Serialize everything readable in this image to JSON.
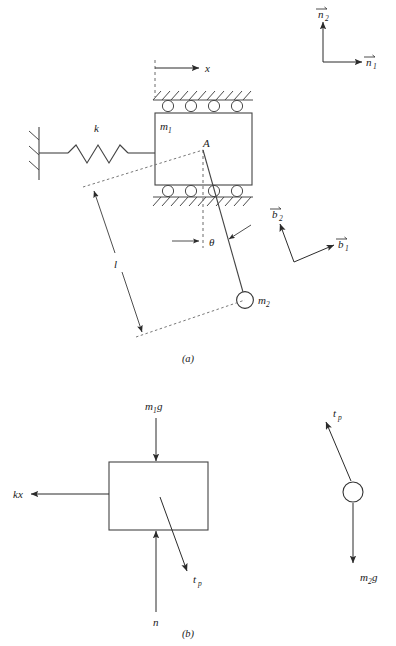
{
  "figure": {
    "panels": [
      {
        "id": "a",
        "label": "(a)",
        "caption": "System schematic"
      },
      {
        "id": "b",
        "label": "(b)",
        "caption": "Free-body diagrams"
      }
    ]
  },
  "panel_a": {
    "labels": {
      "spring_constant": "k",
      "cart_mass": "m",
      "cart_mass_sub": "1",
      "bob_mass": "m",
      "bob_mass_sub": "2",
      "displacement": "x",
      "pivot": "A",
      "rod_length": "l",
      "angle": "θ"
    },
    "basis_n": {
      "e1": "n",
      "e1_sub": "1",
      "e2": "n",
      "e2_sub": "2"
    },
    "basis_b": {
      "e1": "b",
      "e1_sub": "1",
      "e2": "b",
      "e2_sub": "2"
    }
  },
  "panel_b": {
    "block_forces": [
      {
        "name": "weight",
        "label": "m",
        "sub": "1",
        "label_tail": "g",
        "direction": "down"
      },
      {
        "name": "spring-force",
        "label": "kx",
        "sub": "",
        "label_tail": "",
        "direction": "left"
      },
      {
        "name": "normal-force",
        "label": "n",
        "sub": "",
        "label_tail": "",
        "direction": "up"
      },
      {
        "name": "rod-tension",
        "label": "t",
        "sub": "p",
        "label_tail": "",
        "direction": "down-right"
      }
    ],
    "bob_forces": [
      {
        "name": "rod-tension",
        "label": "t",
        "sub": "p",
        "label_tail": "",
        "direction": "up-left"
      },
      {
        "name": "weight",
        "label": "m",
        "sub": "2",
        "label_tail": "g",
        "direction": "down"
      }
    ]
  },
  "style": {
    "ink": "#2b2b2b",
    "dash": "#6b6b6b",
    "background": "#ffffff"
  }
}
